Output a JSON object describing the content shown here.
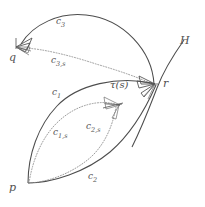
{
  "figure": {
    "kind": "mathematical-diagram",
    "background_color": "#ffffff",
    "ink_color": "#4d4d4d",
    "dotted_color": "#8a8a8a",
    "points": [
      {
        "id": "q",
        "label": "q",
        "x": 13,
        "y": 58
      },
      {
        "id": "p",
        "label": "p",
        "x": 13,
        "y": 188
      },
      {
        "id": "r",
        "label": "r",
        "x": 166,
        "y": 84
      }
    ],
    "curves": [
      {
        "id": "c1",
        "label": "c",
        "sub": "1",
        "style": "solid",
        "from": "p",
        "to": "r",
        "label_x": 54,
        "label_y": 93
      },
      {
        "id": "c2",
        "label": "c",
        "sub": "2",
        "style": "solid",
        "from": "p",
        "to": "r",
        "label_x": 91,
        "label_y": 177
      },
      {
        "id": "c3",
        "label": "c",
        "sub": "3",
        "style": "solid",
        "from": "r",
        "to": "q",
        "label_x": 59,
        "label_y": 22
      },
      {
        "id": "c1s",
        "label": "c",
        "sub": "1,s",
        "style": "dotted",
        "from": "p",
        "to": "tau",
        "label_x": 56,
        "label_y": 133
      },
      {
        "id": "c2s",
        "label": "c",
        "sub": "2,s",
        "style": "dotted",
        "from": "p",
        "to": "tau",
        "label_x": 89,
        "label_y": 127
      },
      {
        "id": "c3s",
        "label": "c",
        "sub": "3,s",
        "style": "dotted",
        "from": "r",
        "to": "q",
        "label_x": 54,
        "label_y": 61
      }
    ],
    "annotations": [
      {
        "id": "tau",
        "label": "τ(s)",
        "label_x": 113,
        "label_y": 85
      },
      {
        "id": "H",
        "label": "H",
        "label_x": 183,
        "label_y": 41
      }
    ]
  }
}
